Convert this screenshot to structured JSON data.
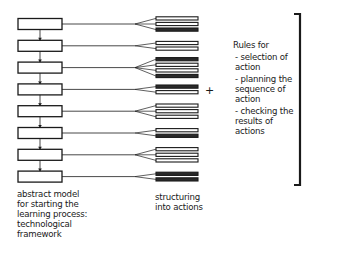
{
  "diagram": {
    "stages": [
      {
        "bars": [
          0,
          0,
          1
        ]
      },
      {
        "bars": [
          0,
          0
        ]
      },
      {
        "bars": [
          1,
          0,
          0,
          1
        ]
      },
      {
        "bars": [
          1,
          0
        ]
      },
      {
        "bars": [
          0,
          0,
          0
        ]
      },
      {
        "bars": [
          0,
          1
        ]
      },
      {
        "bars": [
          0,
          0,
          0
        ]
      },
      {
        "bars": [
          1,
          1
        ]
      }
    ],
    "left_caption": [
      "abstract model",
      "for starting the",
      "learning process:",
      "technological",
      "framework"
    ],
    "mid_caption": [
      "structuring",
      "into actions"
    ],
    "plus_sign": "+",
    "rules": {
      "heading": "Rules for",
      "items": [
        [
          "- selection of",
          "action"
        ],
        [
          "- planning the",
          "sequence of",
          "action"
        ],
        [
          "- checking the",
          "results of",
          "actions"
        ]
      ]
    },
    "colors": {
      "ink": "#1a1a1a",
      "background": "#ffffff"
    }
  }
}
